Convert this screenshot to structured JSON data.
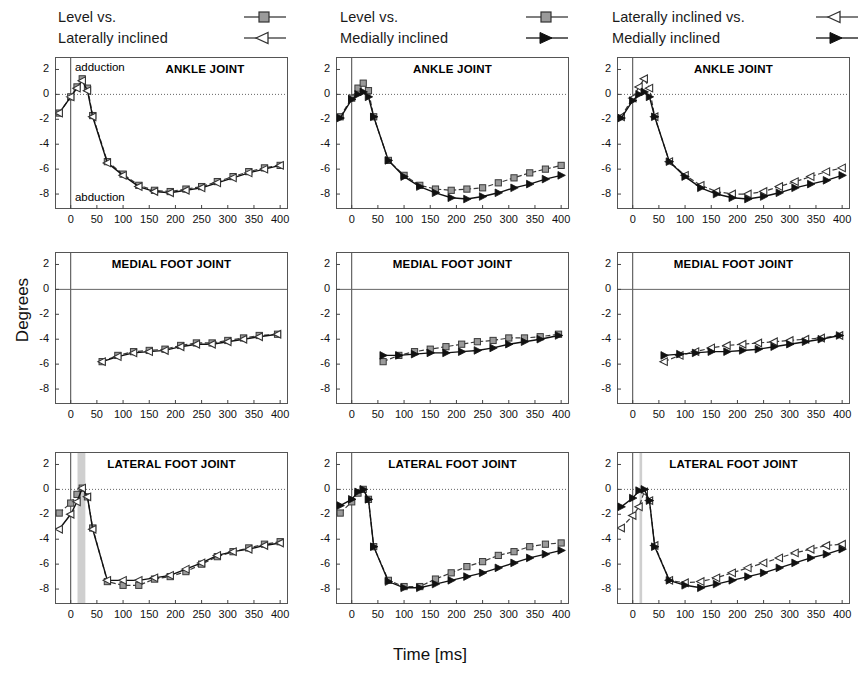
{
  "figure": {
    "xlabel": "Time [ms]",
    "ylabel": "Degrees",
    "annotations": {
      "top": "adduction",
      "bottom": "abduction"
    },
    "colors": {
      "series_a": "#8c8c8c",
      "series_b": "#111111",
      "band": "#a8a8a8",
      "frame": "#555555"
    }
  },
  "legends": [
    {
      "line1": "Level vs.",
      "line2": "Laterally inclined",
      "marker1": "filled-square-marker",
      "marker2": "open-left-triangle-marker"
    },
    {
      "line1": "Level vs.",
      "line2": "Medially inclined",
      "marker1": "filled-square-marker",
      "marker2": "filled-right-triangle-marker"
    },
    {
      "line1": "Laterally inclined vs.",
      "line2": "Medially inclined",
      "marker1": "open-left-triangle-marker",
      "marker2": "filled-right-triangle-marker"
    }
  ],
  "axes": {
    "yticks": [
      "2",
      "0",
      "-2",
      "-4",
      "-6",
      "-8"
    ],
    "ytick_values": [
      2,
      0,
      -2,
      -4,
      -6,
      -8
    ],
    "xticks": [
      "0",
      "50",
      "100",
      "150",
      "200",
      "250",
      "300",
      "350",
      "400"
    ],
    "xtick_values": [
      0,
      50,
      100,
      150,
      200,
      250,
      300,
      350,
      400
    ],
    "xlim": [
      -30,
      415
    ],
    "ylim": [
      -9.2,
      3.0
    ]
  },
  "chart_data": [
    {
      "id": "panel-r1c1",
      "type": "line",
      "title": "ANKLE JOINT",
      "xlabel": "Time [ms]",
      "ylabel": "Degrees",
      "xlim": [
        -30,
        415
      ],
      "ylim": [
        -9.2,
        3.0
      ],
      "grid": "zero-line-dotted",
      "annotations": [
        "adduction",
        "abduction"
      ],
      "shaded_band": null,
      "series": [
        {
          "name": "Level",
          "marker": "filled-square-marker",
          "color": "#8c8c8c",
          "x": [
            -22,
            0,
            12,
            22,
            32,
            42,
            70,
            100,
            130,
            160,
            190,
            220,
            250,
            280,
            310,
            340,
            370,
            400
          ],
          "values": [
            -1.5,
            -0.2,
            0.6,
            1.25,
            0.5,
            -1.7,
            -5.4,
            -6.4,
            -7.3,
            -7.7,
            -7.8,
            -7.6,
            -7.4,
            -7.0,
            -6.6,
            -6.2,
            -5.9,
            -5.7
          ]
        },
        {
          "name": "Laterally inclined",
          "marker": "open-left-triangle-marker",
          "color": "#222222",
          "x": [
            -22,
            0,
            12,
            22,
            32,
            42,
            70,
            100,
            130,
            160,
            190,
            220,
            250,
            280,
            310,
            340,
            370,
            400
          ],
          "values": [
            -1.5,
            -0.2,
            0.5,
            1.1,
            0.3,
            -1.8,
            -5.5,
            -6.5,
            -7.4,
            -7.8,
            -7.9,
            -7.7,
            -7.5,
            -7.1,
            -6.7,
            -6.3,
            -6.0,
            -5.7
          ]
        }
      ]
    },
    {
      "id": "panel-r1c2",
      "type": "line",
      "title": "ANKLE JOINT",
      "xlim": [
        -30,
        415
      ],
      "ylim": [
        -9.2,
        3.0
      ],
      "grid": "zero-line-dotted",
      "shaded_band": null,
      "series": [
        {
          "name": "Level",
          "marker": "filled-square-marker",
          "color": "#8c8c8c",
          "x": [
            -22,
            0,
            12,
            22,
            32,
            42,
            70,
            100,
            130,
            160,
            190,
            220,
            250,
            280,
            310,
            340,
            370,
            400
          ],
          "values": [
            -1.8,
            -0.3,
            0.5,
            0.9,
            0.3,
            -1.8,
            -5.3,
            -6.5,
            -7.3,
            -7.6,
            -7.7,
            -7.6,
            -7.5,
            -7.1,
            -6.7,
            -6.3,
            -6.0,
            -5.7
          ]
        },
        {
          "name": "Medially inclined",
          "marker": "filled-right-triangle-marker",
          "color": "#111111",
          "x": [
            -22,
            0,
            12,
            22,
            32,
            42,
            70,
            100,
            130,
            160,
            190,
            220,
            250,
            280,
            310,
            340,
            370,
            400
          ],
          "values": [
            -1.9,
            -0.4,
            0.0,
            0.2,
            -0.2,
            -1.8,
            -5.3,
            -6.6,
            -7.4,
            -7.9,
            -8.3,
            -8.4,
            -8.2,
            -7.9,
            -7.5,
            -7.2,
            -6.8,
            -6.5
          ]
        }
      ]
    },
    {
      "id": "panel-r1c3",
      "type": "line",
      "title": "ANKLE JOINT",
      "xlim": [
        -30,
        415
      ],
      "ylim": [
        -9.2,
        3.0
      ],
      "grid": "zero-line-dotted",
      "shaded_band": null,
      "series": [
        {
          "name": "Laterally inclined",
          "marker": "open-left-triangle-marker",
          "color": "#8c8c8c",
          "x": [
            -22,
            0,
            12,
            22,
            32,
            42,
            70,
            100,
            130,
            160,
            190,
            220,
            250,
            280,
            310,
            340,
            370,
            400
          ],
          "values": [
            -1.8,
            -0.3,
            0.6,
            1.25,
            0.5,
            -1.8,
            -5.4,
            -6.5,
            -7.3,
            -7.8,
            -8.0,
            -8.0,
            -7.8,
            -7.4,
            -7.0,
            -6.6,
            -6.2,
            -5.9
          ]
        },
        {
          "name": "Medially inclined",
          "marker": "filled-right-triangle-marker",
          "color": "#111111",
          "x": [
            -22,
            0,
            12,
            22,
            32,
            42,
            70,
            100,
            130,
            160,
            190,
            220,
            250,
            280,
            310,
            340,
            370,
            400
          ],
          "values": [
            -1.9,
            -0.5,
            0.0,
            0.2,
            -0.2,
            -1.8,
            -5.4,
            -6.6,
            -7.5,
            -8.0,
            -8.3,
            -8.4,
            -8.2,
            -7.9,
            -7.5,
            -7.2,
            -6.9,
            -6.5
          ]
        }
      ]
    },
    {
      "id": "panel-r2c1",
      "type": "line",
      "title": "MEDIAL FOOT JOINT",
      "xlim": [
        -30,
        415
      ],
      "ylim": [
        -9.2,
        3.0
      ],
      "grid": "zero-line-solid",
      "shaded_band": null,
      "series": [
        {
          "name": "Level",
          "marker": "filled-square-marker",
          "color": "#8c8c8c",
          "x": [
            60,
            90,
            120,
            150,
            180,
            210,
            240,
            270,
            300,
            330,
            360,
            395
          ],
          "values": [
            -5.8,
            -5.3,
            -5.0,
            -4.9,
            -4.8,
            -4.5,
            -4.3,
            -4.3,
            -4.1,
            -3.9,
            -3.7,
            -3.6
          ]
        },
        {
          "name": "Laterally inclined",
          "marker": "open-left-triangle-marker",
          "color": "#222222",
          "x": [
            60,
            90,
            120,
            150,
            180,
            210,
            240,
            270,
            300,
            330,
            360,
            395
          ],
          "values": [
            -5.8,
            -5.4,
            -5.1,
            -5.0,
            -4.9,
            -4.6,
            -4.4,
            -4.4,
            -4.2,
            -4.0,
            -3.8,
            -3.6
          ]
        }
      ]
    },
    {
      "id": "panel-r2c2",
      "type": "line",
      "title": "MEDIAL FOOT JOINT",
      "xlim": [
        -30,
        415
      ],
      "ylim": [
        -9.2,
        3.0
      ],
      "grid": "zero-line-solid",
      "shaded_band": null,
      "series": [
        {
          "name": "Level",
          "marker": "filled-square-marker",
          "color": "#8c8c8c",
          "x": [
            60,
            90,
            120,
            150,
            180,
            210,
            240,
            270,
            300,
            330,
            360,
            395
          ],
          "values": [
            -5.8,
            -5.3,
            -5.0,
            -4.8,
            -4.6,
            -4.4,
            -4.2,
            -4.1,
            -3.9,
            -3.9,
            -3.8,
            -3.6
          ]
        },
        {
          "name": "Medially inclined",
          "marker": "filled-right-triangle-marker",
          "color": "#111111",
          "x": [
            60,
            90,
            120,
            150,
            180,
            210,
            240,
            270,
            300,
            330,
            360,
            395
          ],
          "values": [
            -5.3,
            -5.3,
            -5.2,
            -5.1,
            -5.1,
            -5.0,
            -4.9,
            -4.7,
            -4.4,
            -4.2,
            -4.0,
            -3.7
          ]
        }
      ]
    },
    {
      "id": "panel-r2c3",
      "type": "line",
      "title": "MEDIAL FOOT JOINT",
      "xlim": [
        -30,
        415
      ],
      "ylim": [
        -9.2,
        3.0
      ],
      "grid": "zero-line-solid",
      "shaded_band": null,
      "series": [
        {
          "name": "Laterally inclined",
          "marker": "open-left-triangle-marker",
          "color": "#8c8c8c",
          "x": [
            60,
            90,
            120,
            150,
            180,
            210,
            240,
            270,
            300,
            330,
            360,
            395
          ],
          "values": [
            -5.8,
            -5.3,
            -5.0,
            -4.7,
            -4.5,
            -4.4,
            -4.3,
            -4.2,
            -4.1,
            -4.0,
            -3.9,
            -3.7
          ]
        },
        {
          "name": "Medially inclined",
          "marker": "filled-right-triangle-marker",
          "color": "#111111",
          "x": [
            60,
            90,
            120,
            150,
            180,
            210,
            240,
            270,
            300,
            330,
            360,
            395
          ],
          "values": [
            -5.3,
            -5.2,
            -5.1,
            -5.0,
            -5.0,
            -4.9,
            -4.8,
            -4.6,
            -4.4,
            -4.2,
            -4.0,
            -3.7
          ]
        }
      ]
    },
    {
      "id": "panel-r3c1",
      "type": "line",
      "title": "LATERAL FOOT JOINT",
      "xlim": [
        -30,
        415
      ],
      "ylim": [
        -9.2,
        3.0
      ],
      "grid": "zero-line-dotted",
      "shaded_band": [
        13,
        28
      ],
      "series": [
        {
          "name": "Level",
          "marker": "filled-square-marker",
          "color": "#8c8c8c",
          "x": [
            -22,
            0,
            12,
            22,
            32,
            42,
            70,
            100,
            130,
            160,
            190,
            220,
            250,
            280,
            310,
            340,
            370,
            400
          ],
          "values": [
            -1.9,
            -1.1,
            -0.4,
            0.1,
            -0.6,
            -3.1,
            -7.4,
            -7.7,
            -7.7,
            -7.2,
            -7.0,
            -6.6,
            -6.0,
            -5.4,
            -5.0,
            -4.7,
            -4.4,
            -4.2
          ]
        },
        {
          "name": "Laterally inclined",
          "marker": "open-left-triangle-marker",
          "color": "#222222",
          "x": [
            -22,
            0,
            12,
            22,
            32,
            42,
            70,
            100,
            130,
            160,
            190,
            220,
            250,
            280,
            310,
            340,
            370,
            400
          ],
          "values": [
            -3.2,
            -2.0,
            -1.0,
            0.1,
            -0.6,
            -3.2,
            -7.3,
            -7.3,
            -7.3,
            -7.1,
            -6.9,
            -6.4,
            -5.9,
            -5.3,
            -5.0,
            -4.8,
            -4.5,
            -4.3
          ]
        }
      ]
    },
    {
      "id": "panel-r3c2",
      "type": "line",
      "title": "LATERAL FOOT JOINT",
      "xlim": [
        -30,
        415
      ],
      "ylim": [
        -9.2,
        3.0
      ],
      "grid": "zero-line-dotted",
      "shaded_band": null,
      "series": [
        {
          "name": "Level",
          "marker": "filled-square-marker",
          "color": "#8c8c8c",
          "x": [
            -22,
            0,
            12,
            22,
            32,
            42,
            70,
            100,
            130,
            160,
            190,
            220,
            250,
            280,
            310,
            340,
            370,
            400
          ],
          "values": [
            -1.9,
            -1.0,
            -0.3,
            0.0,
            -0.8,
            -4.6,
            -7.3,
            -7.8,
            -7.8,
            -7.2,
            -6.7,
            -6.2,
            -5.8,
            -5.3,
            -5.0,
            -4.6,
            -4.4,
            -4.3
          ]
        },
        {
          "name": "Medially inclined",
          "marker": "filled-right-triangle-marker",
          "color": "#111111",
          "x": [
            -22,
            0,
            12,
            22,
            32,
            42,
            70,
            100,
            130,
            160,
            190,
            220,
            250,
            280,
            310,
            340,
            370,
            400
          ],
          "values": [
            -1.3,
            -0.8,
            -0.2,
            0.0,
            -0.8,
            -4.6,
            -7.4,
            -7.9,
            -7.9,
            -7.6,
            -7.3,
            -7.0,
            -6.7,
            -6.3,
            -5.9,
            -5.5,
            -5.2,
            -4.9
          ]
        }
      ]
    },
    {
      "id": "panel-r3c3",
      "type": "line",
      "title": "LATERAL FOOT JOINT",
      "xlim": [
        -30,
        415
      ],
      "ylim": [
        -9.2,
        3.0
      ],
      "grid": "zero-line-dotted",
      "shaded_band": [
        13,
        18
      ],
      "series": [
        {
          "name": "Laterally inclined",
          "marker": "open-left-triangle-marker",
          "color": "#8c8c8c",
          "x": [
            -22,
            0,
            12,
            22,
            32,
            42,
            70,
            100,
            130,
            160,
            190,
            220,
            250,
            280,
            310,
            340,
            370,
            400
          ],
          "values": [
            -3.1,
            -2.1,
            -1.4,
            -0.2,
            -0.9,
            -4.5,
            -7.3,
            -7.5,
            -7.4,
            -7.1,
            -6.7,
            -6.3,
            -5.9,
            -5.5,
            -5.1,
            -4.8,
            -4.5,
            -4.4
          ]
        },
        {
          "name": "Medially inclined",
          "marker": "filled-right-triangle-marker",
          "color": "#111111",
          "x": [
            -22,
            0,
            12,
            22,
            32,
            42,
            70,
            100,
            130,
            160,
            190,
            220,
            250,
            280,
            310,
            340,
            370,
            400
          ],
          "values": [
            -1.4,
            -0.7,
            -0.1,
            0.0,
            -0.9,
            -4.6,
            -7.3,
            -7.7,
            -7.9,
            -7.6,
            -7.3,
            -7.0,
            -6.7,
            -6.3,
            -5.9,
            -5.5,
            -5.2,
            -4.8
          ]
        }
      ]
    }
  ]
}
